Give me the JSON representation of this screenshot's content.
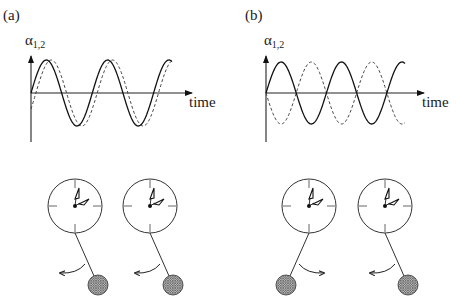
{
  "figure": {
    "panels": [
      {
        "id": "a",
        "label": "(a)",
        "y_label_main": "α",
        "y_label_sub": "1,2",
        "x_label": "time",
        "mode": "in-phase",
        "signals": [
          {
            "name": "pendulum-1",
            "style": "solid",
            "cycles": 2.3,
            "phase_offset_cycles": 0.0
          },
          {
            "name": "pendulum-2",
            "style": "dashed",
            "cycles": 2.3,
            "phase_offset_cycles": -0.08
          }
        ],
        "clocks": [
          {
            "name": "clock-1",
            "pendulum_side": "right",
            "swing_direction": "left"
          },
          {
            "name": "clock-2",
            "pendulum_side": "right",
            "swing_direction": "left"
          }
        ]
      },
      {
        "id": "b",
        "label": "(b)",
        "y_label_main": "α",
        "y_label_sub": "1,2",
        "x_label": "time",
        "mode": "anti-phase",
        "signals": [
          {
            "name": "pendulum-1",
            "style": "solid",
            "cycles": 2.3,
            "phase_offset_cycles": 0.0
          },
          {
            "name": "pendulum-2",
            "style": "dashed",
            "cycles": 2.3,
            "phase_offset_cycles": 0.5
          }
        ],
        "clocks": [
          {
            "name": "clock-1",
            "pendulum_side": "left",
            "swing_direction": "right"
          },
          {
            "name": "clock-2",
            "pendulum_side": "right",
            "swing_direction": "left"
          }
        ]
      }
    ],
    "colors": {
      "line": "#111111",
      "bob_hatch": "#555555",
      "background": "#ffffff"
    }
  }
}
